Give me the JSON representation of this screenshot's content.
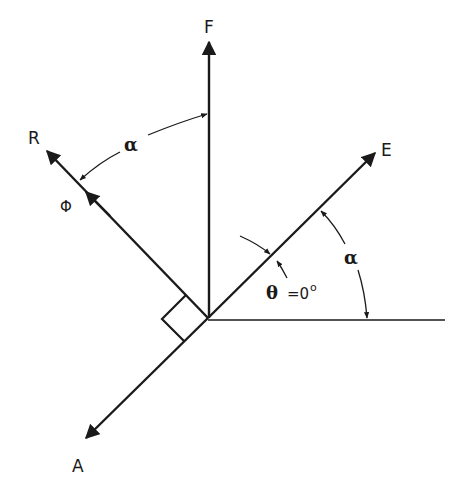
{
  "diagram": {
    "colors": {
      "ink": "#1a1a1a",
      "background": "#ffffff"
    },
    "vectors": [
      {
        "id": "F",
        "label": "F"
      },
      {
        "id": "R",
        "label": "R"
      },
      {
        "id": "E",
        "label": "E"
      },
      {
        "id": "A",
        "label": "A"
      }
    ],
    "labels": {
      "F": "F",
      "R": "R",
      "E": "E",
      "A": "A",
      "phi": "Φ",
      "alpha_top": "α",
      "alpha_right": "α",
      "theta": "θ",
      "theta_value": "=0",
      "theta_degree": "o"
    },
    "annotations": {
      "right_angle": "R ⟂ A-E axis",
      "angle_F_R": "α",
      "angle_E_horizontal": "α",
      "angle_theta": "θ = 0°"
    }
  }
}
